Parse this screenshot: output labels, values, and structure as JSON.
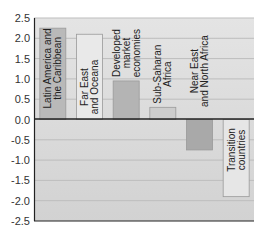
{
  "chart_data": {
    "type": "bar",
    "title": "",
    "xlabel": "",
    "ylabel": "",
    "ylim": [
      -2.5,
      2.5
    ],
    "yticks": [
      "2.5",
      "2.0",
      "1.5",
      "1.0",
      "0.5",
      "0.0",
      "-0.5",
      "-1.0",
      "-1.5",
      "-2.0",
      "-2.5"
    ],
    "grid": true,
    "legend": "none",
    "categories": [
      [
        "Latin America and",
        "the Caribbean"
      ],
      [
        "Far East",
        "and Oceana"
      ],
      [
        "Developed",
        "market",
        "economies"
      ],
      [
        "Sub-Saharan",
        "Africa"
      ],
      [
        "Near East",
        "and North Africa"
      ],
      [
        "Transition",
        "countries"
      ]
    ],
    "values": [
      2.25,
      2.1,
      0.95,
      0.3,
      -0.75,
      -1.9
    ],
    "bar_colors": [
      "#b9b9b9",
      "#e9e9e9",
      "#b4b4b4",
      "#cdcdcd",
      "#a9a9a9",
      "#e6e6e6"
    ]
  },
  "colors": {
    "plot_bg": "#d7d7d7",
    "plot_bg_top": "#e2e2e2",
    "grid": "#bdbdbd",
    "axis": "#222222"
  }
}
